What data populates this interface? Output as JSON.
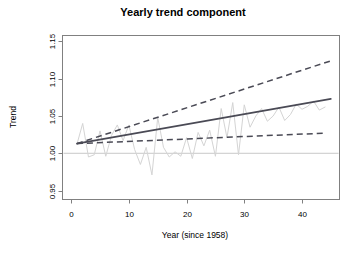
{
  "chart_data": {
    "type": "line",
    "title": "Yearly trend component",
    "xlabel": "Year (since 1958)",
    "ylabel": "Trend",
    "xlim": [
      -1.5,
      46.5
    ],
    "ylim": [
      0.938,
      1.158
    ],
    "xticks": [
      0,
      10,
      20,
      30,
      40
    ],
    "xtick_labels": [
      "0",
      "10",
      "20",
      "30",
      "40"
    ],
    "yticks": [
      0.95,
      1.0,
      1.05,
      1.1,
      1.15
    ],
    "ytick_labels": [
      "0.95",
      "1.00",
      "1.05",
      "1.10",
      "1.15"
    ],
    "grid": false,
    "legend": "none",
    "reference_line": {
      "y": 1.0,
      "orientation": "horizontal",
      "color": "#c8c8c8"
    },
    "colors": {
      "observed": "#d4d4d4",
      "trend": "#4a4a55",
      "band": "#4a4a55",
      "frame": "#808080",
      "reference": "#c8c8c8"
    },
    "series": [
      {
        "name": "observed",
        "style": "solid-thin",
        "color": "#d4d4d4",
        "x": [
          1,
          2,
          3,
          4,
          5,
          6,
          7,
          8,
          9,
          10,
          11,
          12,
          13,
          14,
          15,
          16,
          17,
          18,
          19,
          20,
          21,
          22,
          23,
          24,
          25,
          26,
          27,
          28,
          29,
          30,
          31,
          32,
          33,
          34,
          35,
          36,
          37,
          38,
          39,
          40,
          41,
          42,
          43,
          44
        ],
        "values": [
          1.012,
          1.04,
          0.995,
          0.998,
          1.03,
          0.996,
          1.024,
          1.038,
          1.017,
          1.038,
          1.005,
          0.985,
          1.008,
          0.971,
          1.048,
          1.008,
          0.995,
          1.002,
          0.996,
          1.021,
          0.993,
          1.028,
          1.01,
          1.031,
          0.996,
          1.06,
          1.021,
          1.068,
          0.998,
          1.065,
          1.035,
          1.05,
          1.06,
          1.043,
          1.05,
          1.062,
          1.044,
          1.052,
          1.066,
          1.059,
          1.063,
          1.07,
          1.058,
          1.062
        ]
      },
      {
        "name": "trend-estimate",
        "style": "solid",
        "color": "#4a4a55",
        "x": [
          1,
          45
        ],
        "values": [
          1.013,
          1.073
        ]
      },
      {
        "name": "upper-confidence-band",
        "style": "dashed",
        "color": "#4a4a55",
        "x": [
          1,
          45
        ],
        "values": [
          1.013,
          1.124
        ]
      },
      {
        "name": "lower-confidence-band",
        "style": "dashed",
        "color": "#4a4a55",
        "x": [
          1,
          44
        ],
        "values": [
          1.013,
          1.027
        ]
      }
    ]
  }
}
